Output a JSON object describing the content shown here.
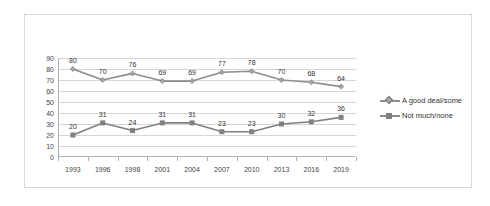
{
  "chart_data": {
    "type": "line",
    "title": "",
    "xlabel": "",
    "ylabel": "",
    "categories": [
      "1993",
      "1996",
      "1998",
      "2001",
      "2004",
      "2007",
      "2010",
      "2013",
      "2016",
      "2019"
    ],
    "series": [
      {
        "name": "A good deal/some",
        "marker": "diamond",
        "color": "#8c8c8c",
        "values": [
          80,
          70,
          76,
          69,
          69,
          77,
          78,
          70,
          68,
          64
        ]
      },
      {
        "name": "Not much/none",
        "marker": "square",
        "color": "#808080",
        "values": [
          20,
          31,
          24,
          31,
          31,
          23,
          23,
          30,
          32,
          36
        ]
      }
    ],
    "ylim": [
      0,
      90
    ],
    "ytick_step": 10,
    "yticks": [
      "90",
      "80",
      "70",
      "60",
      "50",
      "40",
      "30",
      "20",
      "10",
      "0"
    ],
    "grid": true,
    "data_labels": true,
    "legend_position": "right",
    "colors": {
      "series1": "#8c8c8c",
      "series2": "#808080",
      "gridline": "#d6d6d6",
      "axis": "#b0b0b0",
      "border": "#d9d9d9",
      "text": "#333333",
      "background": "#ffffff"
    }
  },
  "legend": {
    "items": [
      {
        "label": "A good deal/some"
      },
      {
        "label": "Not much/none"
      }
    ]
  }
}
